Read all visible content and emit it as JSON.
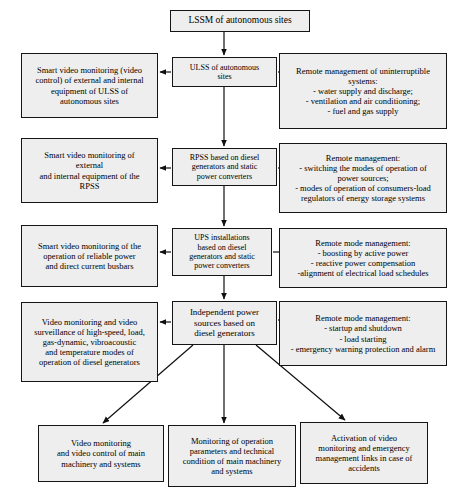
{
  "diagram": {
    "type": "block-hierarchy",
    "background_color": "#ffffff",
    "node_fill_color": "#eeeeee",
    "node_border_color": "#151515",
    "connector_color": "#101010"
  },
  "nodes": {
    "root": {
      "label": "LSSM of autonomous sites",
      "x": 170,
      "y": 10,
      "w": 140,
      "h": 22
    },
    "spine": [
      {
        "id": "ulss",
        "label": "ULSS of autonomous\nsites",
        "x": 172,
        "y": 57,
        "w": 105,
        "h": 30
      },
      {
        "id": "rpss",
        "label": "RPSS based on diesel\ngenerators and static\npower converters",
        "x": 172,
        "y": 148,
        "w": 105,
        "h": 38
      },
      {
        "id": "ups",
        "label": "UPS installations\nbased on diesel\ngenerators and static\npower converters",
        "x": 172,
        "y": 228,
        "w": 100,
        "h": 48
      },
      {
        "id": "ips",
        "label": "Independent power\nsources based on\ndiesel generators",
        "x": 172,
        "y": 301,
        "w": 105,
        "h": 44
      }
    ],
    "left": [
      {
        "id": "left-ulss",
        "label": "Smart video monitoring (video\ncontrol) of external and internal\nequipment of ULSS of\nautonomous sites",
        "x": 21,
        "y": 53,
        "w": 137,
        "h": 65
      },
      {
        "id": "left-rpss",
        "label": "Smart video monitoring of\nexternal\nand internal equipment of the\nRPSS",
        "x": 21,
        "y": 138,
        "w": 137,
        "h": 65
      },
      {
        "id": "left-ups",
        "label": "Smart video monitoring of the\noperation of reliable power\nand direct current busbars",
        "x": 21,
        "y": 225,
        "w": 137,
        "h": 62
      },
      {
        "id": "left-ips",
        "label": "Video monitoring and video\nsurveillance of high-speed, load,\ngas-dynamic, vibroacoustic\nand temperature modes of\noperation of diesel generators",
        "x": 21,
        "y": 302,
        "w": 137,
        "h": 80
      }
    ],
    "right": [
      {
        "id": "right-ulss",
        "label": "Remote management of uninterruptible\nsystems:\n- water supply and discharge;\n- ventilation and air conditioning;\n- fuel and gas supply",
        "x": 279,
        "y": 53,
        "w": 168,
        "h": 76
      },
      {
        "id": "right-rpss",
        "label": "Remote management:\n- switching the modes of operation of\npower sources;\n- modes of operation of consumers-load\nregulators of energy storage systems",
        "x": 279,
        "y": 143,
        "w": 168,
        "h": 70
      },
      {
        "id": "right-ups",
        "label": "Remote mode management:\n- boosting by active power\n- reactive power compensation\n-alignment of electrical load schedules",
        "x": 279,
        "y": 228,
        "w": 168,
        "h": 60
      },
      {
        "id": "right-ips",
        "label": "Remote mode management:\n- startup and shutdown\n- load starting\n- emergency warning protection and alarm",
        "x": 279,
        "y": 301,
        "w": 168,
        "h": 65
      }
    ],
    "bottom": [
      {
        "id": "bottom-video-control",
        "label": "Video monitoring\nand video control of main\nmachinery and systems",
        "x": 38,
        "y": 425,
        "w": 126,
        "h": 57
      },
      {
        "id": "bottom-operation-params",
        "label": "Monitoring of operation\nparameters and technical\ncondition of main machinery\nand systems",
        "x": 168,
        "y": 425,
        "w": 128,
        "h": 62
      },
      {
        "id": "bottom-activation",
        "label": "Activation of video\nmonitoring and emergency\nmanagement links in case of\naccidents",
        "x": 300,
        "y": 422,
        "w": 128,
        "h": 62
      }
    ]
  },
  "connectors": [
    {
      "name": "root-to-ulss",
      "from": "root",
      "to": "ulss",
      "kind": "down-arrow"
    },
    {
      "name": "ulss-to-left",
      "from": "ulss",
      "to": "left-ulss",
      "kind": "left-arrow"
    },
    {
      "name": "ulss-to-right",
      "from": "ulss",
      "to": "right-ulss",
      "kind": "right-arrow"
    },
    {
      "name": "ulss-to-rpss",
      "from": "ulss",
      "to": "rpss",
      "kind": "down-arrow"
    },
    {
      "name": "rpss-to-left",
      "from": "rpss",
      "to": "left-rpss",
      "kind": "left-arrow"
    },
    {
      "name": "rpss-to-right",
      "from": "rpss",
      "to": "right-rpss",
      "kind": "right-arrow"
    },
    {
      "name": "rpss-to-ups",
      "from": "rpss",
      "to": "ups",
      "kind": "down-arrow"
    },
    {
      "name": "ups-to-left",
      "from": "ups",
      "to": "left-ups",
      "kind": "left-arrow"
    },
    {
      "name": "ups-to-right",
      "from": "ups",
      "to": "right-ups",
      "kind": "right-arrow"
    },
    {
      "name": "ups-to-ips",
      "from": "ups",
      "to": "ips",
      "kind": "down-arrow"
    },
    {
      "name": "ips-to-left",
      "from": "ips",
      "to": "left-ips",
      "kind": "left-arrow"
    },
    {
      "name": "ips-to-right",
      "from": "ips",
      "to": "right-ips",
      "kind": "right-arrow"
    },
    {
      "name": "ips-to-bottom-1",
      "from": "ips",
      "to": "bottom-video-control",
      "kind": "diagonal-arrow"
    },
    {
      "name": "ips-to-bottom-2",
      "from": "ips",
      "to": "bottom-operation-params",
      "kind": "down-arrow"
    },
    {
      "name": "ips-to-bottom-3",
      "from": "ips",
      "to": "bottom-activation",
      "kind": "diagonal-arrow"
    }
  ]
}
